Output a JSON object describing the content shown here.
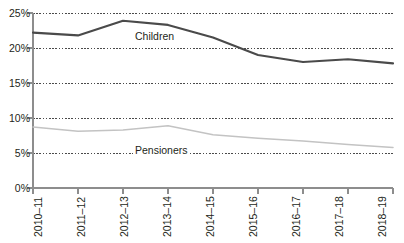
{
  "chart_data": {
    "type": "line",
    "title": "",
    "subtitle": "",
    "xlabel": "",
    "ylabel": "",
    "categories": [
      "2010–11",
      "2011–12",
      "2012–13",
      "2013–14",
      "2014–15",
      "2015–16",
      "2016–17",
      "2017–18",
      "2018–19"
    ],
    "ylim": [
      0,
      25
    ],
    "ytick_labels": [
      "0%",
      "5%",
      "10%",
      "15%",
      "20%",
      "25%"
    ],
    "ytick_values": [
      0,
      5,
      10,
      15,
      20,
      25
    ],
    "grid": "horizontal-dotted",
    "legend_position": "inline-annotations",
    "series": [
      {
        "name": "Children",
        "color": "#4a4a4a",
        "values": [
          22.2,
          21.8,
          23.9,
          23.3,
          21.5,
          19.0,
          18.0,
          18.4,
          17.8
        ]
      },
      {
        "name": "Pensioners",
        "color": "#c3c3c3",
        "values": [
          8.7,
          8.1,
          8.3,
          8.9,
          7.6,
          7.1,
          6.7,
          6.2,
          5.8
        ]
      }
    ],
    "annotations": [
      {
        "text": "Children",
        "series": "Children"
      },
      {
        "text": "Pensioners",
        "series": "Pensioners"
      }
    ]
  },
  "axis": {
    "y_labels": [
      "25%",
      "20%",
      "15%",
      "10%",
      "5%",
      "0%"
    ],
    "x_labels": [
      "2010–11",
      "2011–12",
      "2012–13",
      "2013–14",
      "2014–15",
      "2015–16",
      "2016–17",
      "2017–18",
      "2018–19"
    ]
  },
  "labels": {
    "children": "Children",
    "pensioners": "Pensioners"
  },
  "colors": {
    "children_line": "#4a4a4a",
    "pensioners_line": "#c3c3c3",
    "axis": "#8d8d8d",
    "gridline": "#4a4a4a",
    "text": "#231f20"
  }
}
